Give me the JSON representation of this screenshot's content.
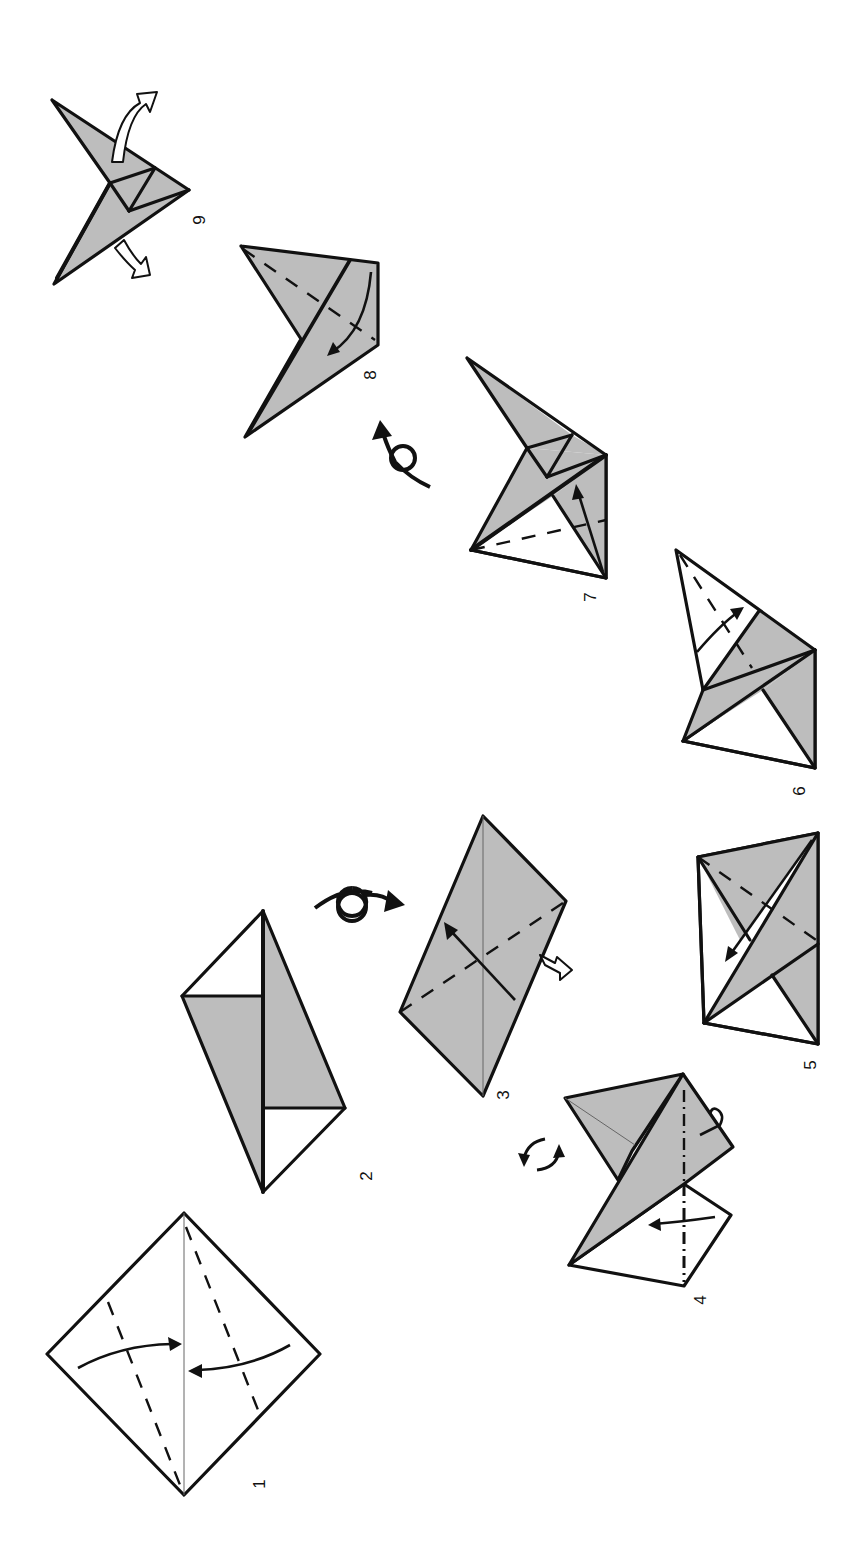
{
  "diagram": {
    "orientation": "rotated 90 degrees clockwise",
    "colors": {
      "paper_front": "#ffffff",
      "paper_back": "#bdbdbd",
      "lines": "#111111",
      "crease": "#666666"
    },
    "legend": {
      "valley_fold": "dashed line",
      "mountain_fold": "dash-dot line",
      "turn_over": "looped arrow",
      "rotate": "circular double arrows",
      "push_in": "open hollow arrow"
    },
    "steps": [
      {
        "number": "1",
        "description": "Square with center crease; valley fold both sides to center"
      },
      {
        "number": "2",
        "description": "Result of folding to the center"
      },
      {
        "number": "3",
        "description": "Turn over; valley fold diagonally, open and squash"
      },
      {
        "number": "4",
        "description": "Rotate; mountain fold behind and fold flap across"
      },
      {
        "number": "5",
        "description": "Valley fold the flap down"
      },
      {
        "number": "6",
        "description": "Valley fold the white flap up"
      },
      {
        "number": "7",
        "description": "Valley fold upward along dashed line"
      },
      {
        "number": "8",
        "description": "Turn over; valley fold down"
      },
      {
        "number": "9",
        "description": "Pull the points apart to finish"
      }
    ]
  }
}
